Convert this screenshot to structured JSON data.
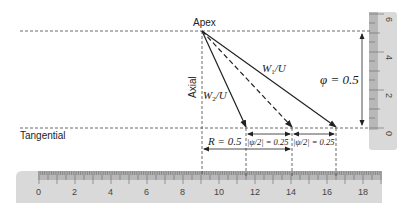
{
  "diagram": {
    "labels": {
      "apex": "Apex",
      "axial": "Axial",
      "tangential": "Tangential",
      "w1": "W",
      "w1_sub": "1",
      "w1_tail": "/U",
      "w2": "W",
      "w2_sub": "2",
      "w2_tail": "/U",
      "phi": "φ = 0.5",
      "R": "R = 0.5",
      "psi_left": "|ψ/2| = 0.25",
      "psi_right": "|ψ/2| = 0.25"
    },
    "values": {
      "phi": 0.5,
      "R": 0.5,
      "psi_half_left": 0.25,
      "psi_half_right": 0.25
    },
    "colors": {
      "line": "#222222",
      "ruler_fill": "#d9d9d9",
      "ruler_scale": "#b5b5b5"
    },
    "vertical_ruler": {
      "ticks": [
        "6",
        "4",
        "2",
        "0"
      ]
    },
    "horizontal_ruler": {
      "ticks": [
        "0",
        "2",
        "4",
        "6",
        "8",
        "10",
        "12",
        "14",
        "16",
        "18"
      ]
    }
  }
}
